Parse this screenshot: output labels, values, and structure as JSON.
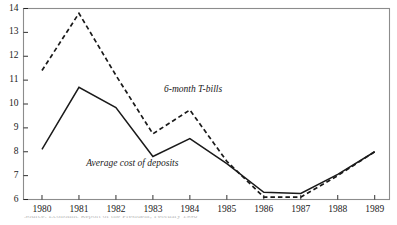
{
  "chart_data": {
    "type": "line",
    "title": "",
    "subtitle": "",
    "xlabel": "",
    "ylabel": "",
    "categories": [
      "1980",
      "1981",
      "1982",
      "1983",
      "1984",
      "1985",
      "1986",
      "1987",
      "1988",
      "1989"
    ],
    "x": [
      1980,
      1981,
      1982,
      1983,
      1984,
      1985,
      1986,
      1987,
      1988,
      1989
    ],
    "xlim": [
      1979.5,
      1989.4
    ],
    "ylim": [
      6,
      14
    ],
    "y_ticks": [
      6,
      7,
      8,
      9,
      10,
      11,
      12,
      13,
      14
    ],
    "y_tick_labels": [
      "6",
      "7",
      "8",
      "9",
      "10",
      "11",
      "12",
      "13",
      "14"
    ],
    "grid": false,
    "legend_position": "inline-annotations",
    "series": [
      {
        "name": "6-month T-bills",
        "style": "dashed",
        "color": "#1a1a1a",
        "values": [
          11.4,
          13.8,
          11.2,
          8.75,
          9.75,
          7.6,
          6.1,
          6.1,
          7.0,
          8.0
        ]
      },
      {
        "name": "Average cost of deposits",
        "style": "solid",
        "color": "#1a1a1a",
        "values": [
          8.1,
          10.7,
          9.85,
          7.8,
          8.55,
          7.5,
          6.3,
          6.25,
          7.05,
          8.0
        ]
      }
    ],
    "annotations": [
      {
        "text": "6-month T-bills",
        "x": 1983.3,
        "y": 10.55
      },
      {
        "text": "Average cost of deposits",
        "x": 1981.2,
        "y": 7.45
      }
    ]
  },
  "axis": {
    "y_labels": [
      "14",
      "13",
      "12",
      "11",
      "10",
      "9",
      "8",
      "7",
      "6"
    ],
    "x_labels": [
      "1980",
      "1981",
      "1982",
      "1983",
      "1984",
      "1985",
      "1986",
      "1987",
      "1988",
      "1989"
    ]
  },
  "annotations": {
    "tbills_label": "6-month T-bills",
    "deposits_label": "Average cost of deposits"
  },
  "caption": {
    "text": "Source: Economic Report of the President, February 1990"
  },
  "colors": {
    "line": "#1a1a1a",
    "frame": "#8c8c8c",
    "text": "#1a1a1a",
    "background": "#ffffff"
  }
}
